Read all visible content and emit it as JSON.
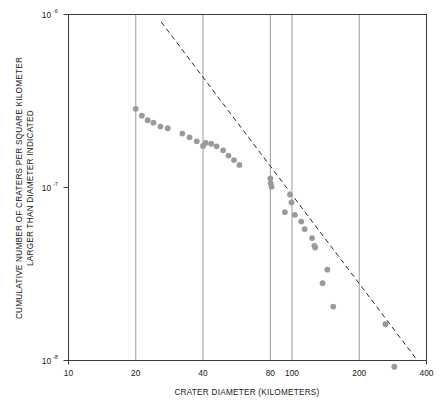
{
  "chart_data": {
    "type": "scatter",
    "title": "",
    "xlabel": "CRATER DIAMETER (KILOMETERS)",
    "ylabel_line1": "CUMULATIVE NUMBER OF CRATERS PER SQUARE KILOMETER",
    "ylabel_line2": "LARGER THAN DIAMETER INDICATED",
    "xscale": "log",
    "yscale": "log",
    "xlim": [
      10,
      400
    ],
    "ylim": [
      1e-08,
      1e-06
    ],
    "grid": "vertical-only",
    "legend": "none",
    "x_ticks": [
      {
        "value": 10,
        "label": "10",
        "gridline": false
      },
      {
        "value": 20,
        "label": "20",
        "gridline": true
      },
      {
        "value": 40,
        "label": "40",
        "gridline": true
      },
      {
        "value": 80,
        "label": "80",
        "gridline": true
      },
      {
        "value": 100,
        "label": "100",
        "gridline": true
      },
      {
        "value": 200,
        "label": "200",
        "gridline": true
      },
      {
        "value": 400,
        "label": "400",
        "gridline": false
      }
    ],
    "y_ticks": [
      {
        "value": 1e-06,
        "mantissa": "10",
        "exponent": "-6"
      },
      {
        "value": 1e-07,
        "mantissa": "10",
        "exponent": "-7"
      },
      {
        "value": 1e-08,
        "mantissa": "10",
        "exponent": "-8"
      }
    ],
    "series": [
      {
        "name": "Cumulative crater density",
        "marker": "filled-circle",
        "color": "#9a9a9a",
        "points": [
          {
            "x": 20.0,
            "y": 2.85e-07
          },
          {
            "x": 21.3,
            "y": 2.6e-07
          },
          {
            "x": 22.6,
            "y": 2.45e-07
          },
          {
            "x": 24.0,
            "y": 2.37e-07
          },
          {
            "x": 25.8,
            "y": 2.25e-07
          },
          {
            "x": 27.8,
            "y": 2.2e-07
          },
          {
            "x": 32.3,
            "y": 2.05e-07
          },
          {
            "x": 34.8,
            "y": 1.95e-07
          },
          {
            "x": 37.5,
            "y": 1.85e-07
          },
          {
            "x": 40.0,
            "y": 1.74e-07
          },
          {
            "x": 41.1,
            "y": 1.81e-07
          },
          {
            "x": 43.5,
            "y": 1.79e-07
          },
          {
            "x": 46.0,
            "y": 1.73e-07
          },
          {
            "x": 49.2,
            "y": 1.64e-07
          },
          {
            "x": 52.0,
            "y": 1.53e-07
          },
          {
            "x": 55.0,
            "y": 1.44e-07
          },
          {
            "x": 58.2,
            "y": 1.35e-07
          },
          {
            "x": 80.0,
            "y": 1.13e-07
          },
          {
            "x": 80.3,
            "y": 1.06e-07
          },
          {
            "x": 81.0,
            "y": 1.01e-07
          },
          {
            "x": 98.0,
            "y": 9.1e-08
          },
          {
            "x": 99.5,
            "y": 8.2e-08
          },
          {
            "x": 93.0,
            "y": 7.2e-08
          },
          {
            "x": 103.0,
            "y": 6.95e-08
          },
          {
            "x": 110.0,
            "y": 6.35e-08
          },
          {
            "x": 114.0,
            "y": 5.75e-08
          },
          {
            "x": 123.0,
            "y": 5.1e-08
          },
          {
            "x": 126.0,
            "y": 4.6e-08
          },
          {
            "x": 127.0,
            "y": 4.5e-08
          },
          {
            "x": 144.0,
            "y": 3.35e-08
          },
          {
            "x": 137.0,
            "y": 2.8e-08
          },
          {
            "x": 153.0,
            "y": 2.05e-08
          },
          {
            "x": 262.0,
            "y": 1.62e-08
          },
          {
            "x": 287.0,
            "y": 9.2e-09
          }
        ]
      }
    ],
    "trendline": {
      "name": "Production function fit",
      "style": "dashed",
      "color": "#2b2b2b",
      "x_start": 26.0,
      "y_start": 9.05e-07,
      "x_end": 360.0,
      "y_end": 1.02e-08
    }
  }
}
